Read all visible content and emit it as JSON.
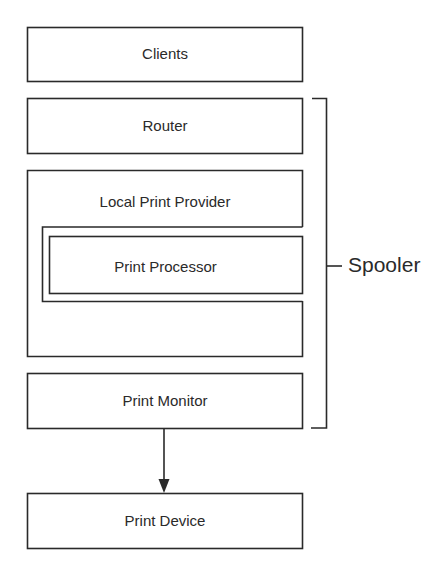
{
  "diagram": {
    "boxes": {
      "clients": "Clients",
      "router": "Router",
      "local_print_provider": "Local Print Provider",
      "print_processor": "Print Processor",
      "print_monitor": "Print Monitor",
      "print_device": "Print Device"
    },
    "bracket_label": "Spooler",
    "edges": [
      {
        "from": "Print Monitor",
        "to": "Print Device",
        "type": "arrow"
      }
    ],
    "colors": {
      "stroke": "#2a2a2a",
      "background": "#ffffff"
    }
  }
}
